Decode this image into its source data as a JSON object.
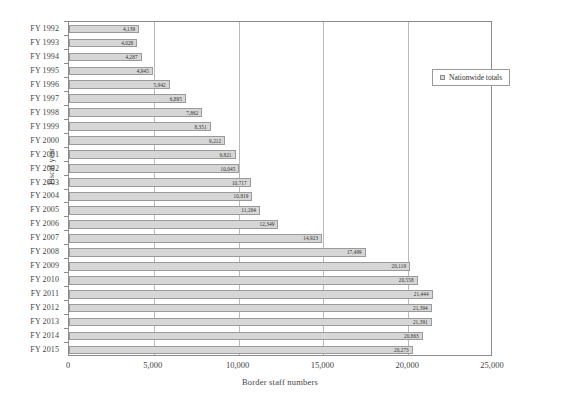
{
  "chart_data": {
    "type": "bar",
    "orientation": "horizontal",
    "title": "",
    "xlabel": "Border staff numbers",
    "ylabel": "Fiscal year",
    "xlim": [
      0,
      25000
    ],
    "xticks": [
      "0",
      "5,000",
      "10,000",
      "15,000",
      "20,000",
      "25,000"
    ],
    "xtick_values": [
      0,
      5000,
      10000,
      15000,
      20000,
      25000
    ],
    "grid": "vertical",
    "legend_position": "upper-right",
    "legend": [
      "Nationwide totals"
    ],
    "categories": [
      "FY 1992",
      "FY 1993",
      "FY 1994",
      "FY 1995",
      "FY 1996",
      "FY 1997",
      "FY 1998",
      "FY 1999",
      "FY 2000",
      "FY 2001",
      "FY 2002",
      "FY 2003",
      "FY 2004",
      "FY 2005",
      "FY 2006",
      "FY 2007",
      "FY 2008",
      "FY 2009",
      "FY 2010",
      "FY 2011",
      "FY 2012",
      "FY 2013",
      "FY 2014",
      "FY 2015"
    ],
    "values": [
      4139,
      4028,
      4287,
      4945,
      5942,
      6895,
      7862,
      8351,
      9212,
      9821,
      10045,
      10717,
      10819,
      11264,
      12349,
      14923,
      17499,
      20119,
      20558,
      21444,
      21394,
      21391,
      20863,
      20273
    ],
    "value_labels": [
      "4,139",
      "4,028",
      "4,287",
      "4,945",
      "5,942",
      "6,895",
      "7,862",
      "8,351",
      "9,212",
      "9,821",
      "10,045",
      "10,717",
      "10,819",
      "11,264",
      "12,349",
      "14,923",
      "17,499",
      "20,119",
      "20,558",
      "21,444",
      "21,394",
      "21,391",
      "20,863",
      "20,273"
    ],
    "series": [
      {
        "name": "Nationwide totals",
        "color": "#d6d6d6",
        "values": [
          4139,
          4028,
          4287,
          4945,
          5942,
          6895,
          7862,
          8351,
          9212,
          9821,
          10045,
          10717,
          10819,
          11264,
          12349,
          14923,
          17499,
          20119,
          20558,
          21444,
          21394,
          21391,
          20863,
          20273
        ]
      }
    ]
  }
}
